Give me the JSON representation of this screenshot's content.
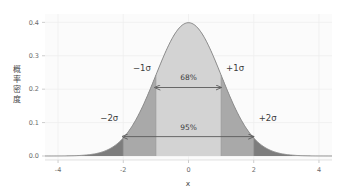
{
  "chart_data": {
    "type": "area",
    "title": "",
    "xlabel": "x",
    "ylabel": "概率密度",
    "xlim": [
      -4.4,
      4.4
    ],
    "ylim": [
      -0.012,
      0.425
    ],
    "xticks": [
      -4,
      -2,
      0,
      2,
      4
    ],
    "xticklabels": [
      "-4",
      "-2",
      "0",
      "2",
      "4"
    ],
    "yticks": [
      0.0,
      0.1,
      0.2,
      0.3,
      0.4
    ],
    "yticklabels": [
      "0.0",
      "0.1",
      "0.2",
      "0.3",
      "0.4"
    ],
    "grid": true,
    "legend": "none",
    "distribution": {
      "name": "standard-normal",
      "mu": 0,
      "sigma": 1,
      "peak_density": 0.3989
    },
    "x": [
      -4.0,
      -3.8,
      -3.6,
      -3.4,
      -3.2,
      -3.0,
      -2.8,
      -2.6,
      -2.4,
      -2.2,
      -2.0,
      -1.8,
      -1.6,
      -1.4,
      -1.2,
      -1.0,
      -0.8,
      -0.6,
      -0.4,
      -0.2,
      0.0,
      0.2,
      0.4,
      0.6,
      0.8,
      1.0,
      1.2,
      1.4,
      1.6,
      1.8,
      2.0,
      2.2,
      2.4,
      2.6,
      2.8,
      3.0,
      3.2,
      3.4,
      3.6,
      3.8,
      4.0
    ],
    "y": [
      0.0001,
      0.0003,
      0.0006,
      0.0012,
      0.0024,
      0.0044,
      0.0079,
      0.0136,
      0.0224,
      0.0355,
      0.054,
      0.079,
      0.1109,
      0.1497,
      0.1942,
      0.242,
      0.2897,
      0.3332,
      0.3683,
      0.391,
      0.3989,
      0.391,
      0.3683,
      0.3332,
      0.2897,
      0.242,
      0.1942,
      0.1497,
      0.1109,
      0.079,
      0.054,
      0.0355,
      0.0224,
      0.0136,
      0.0079,
      0.0044,
      0.0024,
      0.0012,
      0.0006,
      0.0003,
      0.0001
    ],
    "bands": [
      {
        "name": "within-1-sigma",
        "from": -1,
        "to": 1,
        "color": "#cfcfcf",
        "coverage_label": "68%"
      },
      {
        "name": "one-to-two-sigma",
        "from": -2,
        "to": 2,
        "color": "#a8a8a8",
        "coverage_label": "95%"
      },
      {
        "name": "beyond-two-sigma",
        "from": -4.4,
        "to": 4.4,
        "color": "#7a7a7a",
        "coverage_label": ""
      }
    ],
    "annotations": [
      {
        "name": "minus-1-sigma",
        "text": "−1σ",
        "x": -1,
        "y": 0.255
      },
      {
        "name": "plus-1-sigma",
        "text": "+1σ",
        "x": 1,
        "y": 0.255
      },
      {
        "name": "minus-2-sigma",
        "text": "−2σ",
        "x": -2,
        "y": 0.105
      },
      {
        "name": "plus-2-sigma",
        "text": "+2σ",
        "x": 2,
        "y": 0.105
      },
      {
        "name": "pct-68",
        "text": "68%",
        "x": 0,
        "y": 0.228
      },
      {
        "name": "pct-95",
        "text": "95%",
        "x": 0,
        "y": 0.078
      }
    ],
    "arrows": [
      {
        "name": "arrow-68",
        "from": -1,
        "to": 1,
        "y": 0.205
      },
      {
        "name": "arrow-95",
        "from": -2,
        "to": 2,
        "y": 0.058
      }
    ],
    "colors": {
      "curve_line": "#8e8e8e",
      "fill_inner": "#d3d3d3",
      "fill_mid": "#a9a9a9",
      "fill_outer": "#7d7d7d",
      "axis_text": "#6b6b6b",
      "grid": "#efefef",
      "plot_background": "#fbfbfb",
      "figure_background": "#ffffff",
      "arrow": "#5a5a5a"
    }
  }
}
